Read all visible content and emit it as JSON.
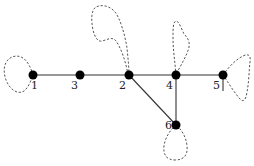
{
  "diagram": {
    "type": "graph",
    "colors": {
      "edge": "#333333",
      "loop": "#555555",
      "node": "#000000",
      "background": "#ffffff"
    },
    "nodes": [
      {
        "id": "1",
        "label": "1",
        "x": 33,
        "y": 75,
        "lx": 27,
        "ly": 80
      },
      {
        "id": "3",
        "label": "3",
        "x": 80,
        "y": 75,
        "lx": 71,
        "ly": 80
      },
      {
        "id": "2",
        "label": "2",
        "x": 129,
        "y": 75,
        "lx": 119,
        "ly": 80
      },
      {
        "id": "4",
        "label": "4",
        "x": 176,
        "y": 75,
        "lx": 166,
        "ly": 80
      },
      {
        "id": "5",
        "label": "5",
        "x": 223,
        "y": 75,
        "lx": 213,
        "ly": 80
      },
      {
        "id": "6",
        "label": "6",
        "x": 176,
        "y": 125,
        "lx": 165,
        "ly": 120
      }
    ],
    "edges": [
      {
        "from": "1",
        "to": "3"
      },
      {
        "from": "3",
        "to": "2"
      },
      {
        "from": "2",
        "to": "4"
      },
      {
        "from": "4",
        "to": "5"
      },
      {
        "from": "2",
        "to": "6"
      },
      {
        "from": "4",
        "to": "6"
      }
    ],
    "loops": [
      {
        "node": "1",
        "style": "dashed"
      },
      {
        "node": "2",
        "style": "dashed"
      },
      {
        "node": "4",
        "style": "dashed"
      },
      {
        "node": "5",
        "style": "dashed"
      },
      {
        "node": "6",
        "style": "dashed"
      }
    ]
  }
}
